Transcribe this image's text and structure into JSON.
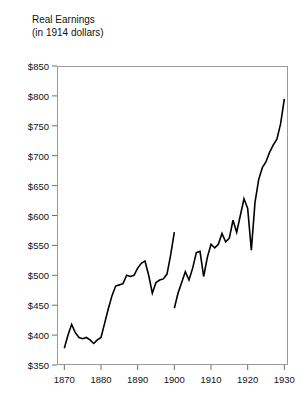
{
  "chart_data": {
    "type": "line",
    "title": "Real Earnings",
    "subtitle": "(in 1914 dollars)",
    "xlabel": "",
    "ylabel": "",
    "xlim": [
      1868,
      1931
    ],
    "ylim": [
      350,
      850
    ],
    "grid": false,
    "legend": null,
    "y_ticks": [
      350,
      400,
      450,
      500,
      550,
      600,
      650,
      700,
      750,
      800,
      850
    ],
    "y_tick_labels": [
      "$350",
      "$400",
      "$450",
      "$500",
      "$550",
      "$600",
      "$650",
      "$700",
      "$750",
      "$800",
      "$850"
    ],
    "x_ticks": [
      1870,
      1880,
      1890,
      1900,
      1910,
      1920,
      1930
    ],
    "x_tick_labels": [
      "1870",
      "1880",
      "1890",
      "1900",
      "1910",
      "1920",
      "1930"
    ],
    "line_color": "#000000",
    "line_width": 1.6,
    "series": [
      {
        "name": "series-1",
        "x": [
          1870,
          1871,
          1872,
          1873,
          1874,
          1875,
          1876,
          1877,
          1878,
          1879,
          1880,
          1881,
          1882,
          1883,
          1884,
          1885,
          1886,
          1887,
          1888,
          1889,
          1890,
          1891,
          1892,
          1893,
          1894,
          1895,
          1896,
          1897,
          1898,
          1899,
          1900
        ],
        "values": [
          378,
          400,
          418,
          404,
          396,
          394,
          396,
          392,
          386,
          392,
          396,
          420,
          444,
          466,
          482,
          484,
          486,
          500,
          498,
          500,
          512,
          520,
          524,
          500,
          470,
          488,
          492,
          494,
          502,
          534,
          572
        ]
      },
      {
        "name": "series-2",
        "x": [
          1900,
          1901,
          1902,
          1903,
          1904,
          1905,
          1906,
          1907,
          1908,
          1909,
          1910,
          1911,
          1912,
          1913,
          1914,
          1915,
          1916,
          1917,
          1918,
          1919,
          1920,
          1921,
          1922,
          1923,
          1924,
          1925,
          1926,
          1927,
          1928,
          1929,
          1930
        ],
        "values": [
          445,
          470,
          488,
          506,
          492,
          512,
          538,
          540,
          498,
          530,
          552,
          546,
          552,
          570,
          556,
          562,
          592,
          572,
          600,
          628,
          612,
          542,
          622,
          660,
          680,
          690,
          706,
          718,
          728,
          754,
          795
        ]
      }
    ]
  }
}
